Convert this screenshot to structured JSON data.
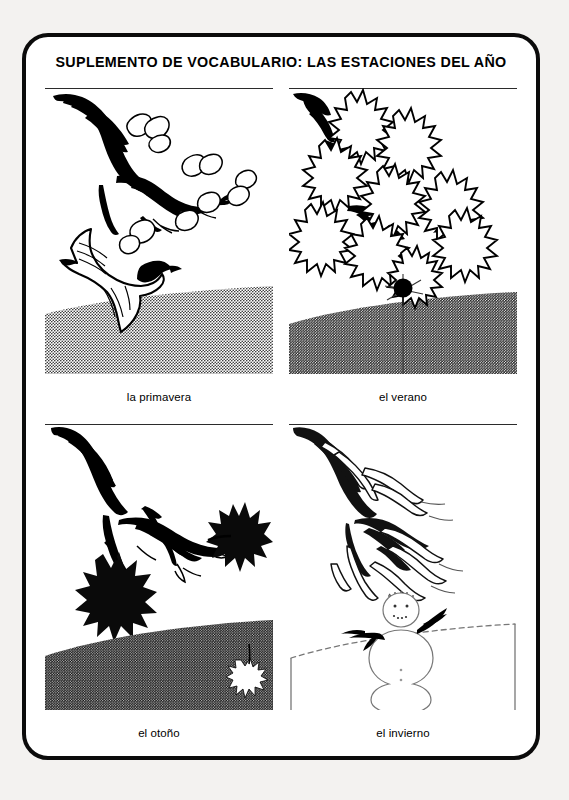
{
  "sheet": {
    "title": "SUPLEMENTO DE VOCABULARIO: LAS ESTACIONES DEL AÑO",
    "border_color": "#0b0b0b",
    "paper_color": "#ffffff",
    "page_background": "#f3f2f0",
    "ink_color": "#000000"
  },
  "panels": [
    {
      "id": "primavera",
      "caption": "la primavera",
      "row": 0,
      "col": 0,
      "scene": "budding-branch-with-flying-bird",
      "branch_state": "bare branch with small outlined buds and leaves",
      "ground": {
        "name": "spring-ground",
        "tone": "light",
        "description": "light halftone field with gently curved top edge"
      },
      "figures": [
        "flying bird"
      ]
    },
    {
      "id": "verano",
      "caption": "el verano",
      "row": 0,
      "col": 1,
      "scene": "full-leafy-branch",
      "branch_state": "branch densely covered with large outlined maple leaves",
      "ground": {
        "name": "summer-ground",
        "tone": "mid",
        "description": "medium halftone field with curved top edge"
      },
      "figures": [
        "dark berry or fruit"
      ]
    },
    {
      "id": "otono",
      "caption": "el otoño",
      "row": 1,
      "col": 0,
      "scene": "bare-branch-with-falling-leaves",
      "branch_state": "bare branch holding two solid black leaves",
      "ground": {
        "name": "autumn-ground",
        "tone": "dark",
        "description": "dark halftone field with a pale fallen leaf at right"
      },
      "figures": [
        "fallen leaf"
      ]
    },
    {
      "id": "invierno",
      "caption": "el invierno",
      "row": 1,
      "col": 1,
      "scene": "snow-covered-branch-with-snowman",
      "branch_state": "bare branch outlined with snow highlights",
      "ground": {
        "name": "winter-ground",
        "tone": "snow",
        "description": "white snowfield bounded by a faint dotted horizon line"
      },
      "figures": [
        "snowman with stick arms"
      ]
    }
  ]
}
